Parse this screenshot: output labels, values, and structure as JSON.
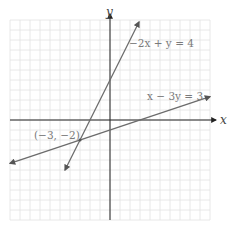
{
  "chart_data": {
    "type": "line",
    "title": "",
    "xlabel": "x",
    "ylabel": "y",
    "xlim": [
      -10,
      10
    ],
    "ylim": [
      -10,
      10
    ],
    "grid": true,
    "grid_step": 1,
    "series": [
      {
        "name": "-2x + y = 4",
        "label": "−2x + y = 4",
        "equation": "y = 2x + 4",
        "slope": 2,
        "intercept": 4,
        "x_range": [
          -4.5,
          2.9
        ],
        "color": "#6b6b6b"
      },
      {
        "name": "x - 3y = 3",
        "label": "x − 3y = 3",
        "equation": "y = (x - 3) / 3",
        "slope": 0.3333,
        "intercept": -1,
        "x_range": [
          -10,
          10
        ],
        "color": "#6b6b6b"
      }
    ],
    "annotations": [
      {
        "text": "(−3, −2)",
        "x": -3,
        "y": -2,
        "type": "intersection-point"
      }
    ]
  }
}
